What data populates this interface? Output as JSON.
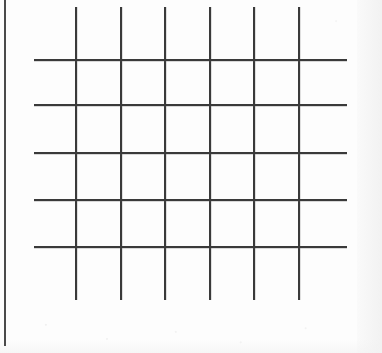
{
  "figure": {
    "caption": "",
    "background_color": "#fdfdfd",
    "stroke_color": "#3a3a3a",
    "margin_rule_color": "#4a4a4a",
    "canvas": {
      "width": 382,
      "height": 353
    }
  },
  "chart_data": {
    "type": "scatter",
    "subtitle": "",
    "xlabel": "",
    "ylabel": "",
    "xlim": [
      0,
      382
    ],
    "ylim": [
      0,
      353
    ],
    "grid": true,
    "legend": "none",
    "tick_labels": {
      "x": [],
      "y": []
    },
    "annotations": [],
    "series": [
      {
        "name": "vertical-strokes",
        "orientation": "vertical",
        "count": 6,
        "x": [
          75,
          120,
          164,
          209,
          253,
          298
        ],
        "span": [
          7,
          300
        ],
        "thickness": 2,
        "color": "#3a3a3a"
      },
      {
        "name": "horizontal-strokes",
        "orientation": "horizontal",
        "count": 5,
        "y": [
          59,
          104,
          152,
          199,
          246
        ],
        "span": [
          34,
          347
        ],
        "thickness": 2,
        "color": "#3a3a3a"
      }
    ],
    "spacing": {
      "vertical_pitch": 44.6,
      "horizontal_pitch": 46.75,
      "cells_wide": 5,
      "cells_tall": 4
    }
  },
  "margin_rule": {
    "label": "page-margin-rule",
    "x": 4,
    "y_start": 0,
    "y_end": 346,
    "thickness": 2
  },
  "page": {
    "caption_text": "",
    "blank_note": "no text content"
  }
}
